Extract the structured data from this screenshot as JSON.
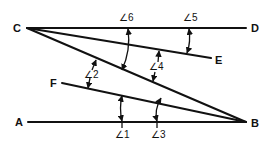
{
  "diagram": {
    "title": "",
    "points": {
      "A": "A",
      "B": "B",
      "C": "C",
      "D": "D",
      "E": "E",
      "F": "F"
    },
    "angles": {
      "a1": "∠1",
      "a2": "∠2",
      "a3": "∠3",
      "a4": "∠4",
      "a5": "∠5",
      "a6": "∠6"
    },
    "segments": [
      {
        "name": "CD",
        "from": "C",
        "to": "D"
      },
      {
        "name": "CE",
        "from": "C",
        "to": "E"
      },
      {
        "name": "CB",
        "from": "C",
        "to": "B"
      },
      {
        "name": "FB",
        "from": "F",
        "to": "B"
      },
      {
        "name": "AB",
        "from": "A",
        "to": "B"
      }
    ],
    "angle_markers": [
      {
        "label": "∠6",
        "between": [
          "CD",
          "CB"
        ]
      },
      {
        "label": "∠5",
        "between": [
          "CD",
          "CE"
        ]
      },
      {
        "label": "∠4",
        "between": [
          "CE",
          "CB"
        ]
      },
      {
        "label": "∠2",
        "between": [
          "CB",
          "FB"
        ]
      },
      {
        "label": "∠1",
        "between": [
          "FB",
          "AB"
        ]
      },
      {
        "label": "∠3",
        "between": [
          "CB",
          "AB"
        ]
      }
    ],
    "colors": {
      "ink": "#111111",
      "background": "#ffffff"
    }
  }
}
